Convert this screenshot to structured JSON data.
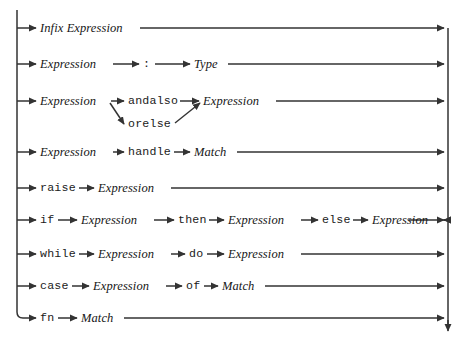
{
  "diagram": {
    "kind": "railroad-syntax-diagram",
    "title": "Expression",
    "ink_color": "#333333",
    "text_color": "#161616",
    "background": "#ffffff",
    "width": 465,
    "height": 342,
    "rails": {
      "left_x": 17,
      "right_x": 448,
      "left_top_y": 10,
      "left_bottom_y": 318,
      "right_top_y": 28,
      "right_bottom_y": 334
    },
    "rows": [
      {
        "id": "row-infix",
        "y": 28,
        "items": [
          {
            "type": "nonterminal",
            "label": "Infix Expression",
            "x": 40,
            "w": 98
          }
        ],
        "tail_to_right_rail": true
      },
      {
        "id": "row-typed",
        "y": 64,
        "items": [
          {
            "type": "nonterminal",
            "label": "Expression",
            "x": 40,
            "w": 70
          },
          {
            "type": "terminal",
            "label": ":",
            "x": 143,
            "w": 8
          },
          {
            "type": "nonterminal",
            "label": "Type",
            "x": 194,
            "w": 30
          }
        ],
        "tail_to_right_rail": true
      },
      {
        "id": "row-andalso-orelse",
        "y": 101,
        "branch_y": 124,
        "items": [
          {
            "type": "nonterminal",
            "label": "Expression",
            "x": 40,
            "w": 70
          },
          {
            "type": "terminal",
            "label": "andalso",
            "x": 128,
            "w": 49
          },
          {
            "type": "terminal",
            "label": "orelse",
            "x": 128,
            "w": 42,
            "branch": true
          },
          {
            "type": "nonterminal",
            "label": "Expression",
            "x": 203,
            "w": 70
          }
        ],
        "tail_to_right_rail": true
      },
      {
        "id": "row-handle",
        "y": 152,
        "items": [
          {
            "type": "nonterminal",
            "label": "Expression",
            "x": 40,
            "w": 70
          },
          {
            "type": "terminal",
            "label": "handle",
            "x": 128,
            "w": 42
          },
          {
            "type": "nonterminal",
            "label": "Match",
            "x": 194,
            "w": 39
          }
        ],
        "tail_to_right_rail": true
      },
      {
        "id": "row-raise",
        "y": 188,
        "items": [
          {
            "type": "terminal",
            "label": "raise",
            "x": 40,
            "w": 35
          },
          {
            "type": "nonterminal",
            "label": "Expression",
            "x": 98,
            "w": 70
          }
        ],
        "tail_to_right_rail": true
      },
      {
        "id": "row-if-then-else",
        "y": 220,
        "items": [
          {
            "type": "terminal",
            "label": "if",
            "x": 40,
            "w": 14
          },
          {
            "type": "nonterminal",
            "label": "Expression",
            "x": 81,
            "w": 70
          },
          {
            "type": "terminal",
            "label": "then",
            "x": 178,
            "w": 28
          },
          {
            "type": "nonterminal",
            "label": "Expression",
            "x": 228,
            "w": 70
          },
          {
            "type": "terminal",
            "label": "else",
            "x": 322,
            "w": 28
          },
          {
            "type": "nonterminal",
            "label": "Expression",
            "x": 372,
            "w": 70
          }
        ],
        "tail_to_right_rail": true
      },
      {
        "id": "row-while-do",
        "y": 254,
        "items": [
          {
            "type": "terminal",
            "label": "while",
            "x": 40,
            "w": 35
          },
          {
            "type": "nonterminal",
            "label": "Expression",
            "x": 98,
            "w": 70
          },
          {
            "type": "terminal",
            "label": "do",
            "x": 189,
            "w": 14
          },
          {
            "type": "nonterminal",
            "label": "Expression",
            "x": 228,
            "w": 70
          }
        ],
        "tail_to_right_rail": true
      },
      {
        "id": "row-case-of",
        "y": 286,
        "items": [
          {
            "type": "terminal",
            "label": "case",
            "x": 40,
            "w": 28
          },
          {
            "type": "nonterminal",
            "label": "Expression",
            "x": 93,
            "w": 70
          },
          {
            "type": "terminal",
            "label": "of",
            "x": 186,
            "w": 14
          },
          {
            "type": "nonterminal",
            "label": "Match",
            "x": 222,
            "w": 39
          }
        ],
        "tail_to_right_rail": true
      },
      {
        "id": "row-fn",
        "y": 318,
        "items": [
          {
            "type": "terminal",
            "label": "fn",
            "x": 40,
            "w": 14
          },
          {
            "type": "nonterminal",
            "label": "Match",
            "x": 81,
            "w": 39
          }
        ],
        "tail_to_right_rail": true
      }
    ]
  }
}
